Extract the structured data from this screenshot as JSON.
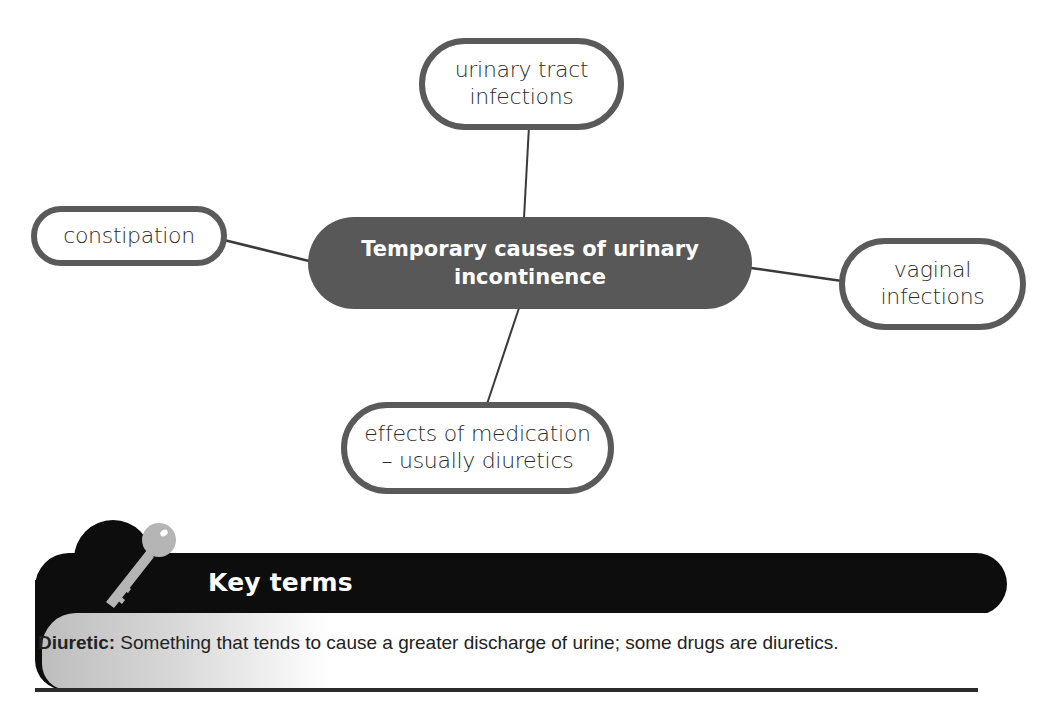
{
  "diagram": {
    "type": "mind-map",
    "center": {
      "lines": [
        "Temporary causes of urinary",
        "incontinence"
      ],
      "fill_color": "#585858",
      "text_color": "#ffffff"
    },
    "branches": [
      {
        "id": "urinary-tract-infections",
        "lines": [
          "urinary tract",
          "infections"
        ],
        "position": "top"
      },
      {
        "id": "constipation",
        "lines": [
          "constipation"
        ],
        "position": "left"
      },
      {
        "id": "vaginal-infections",
        "lines": [
          "vaginal",
          "infections"
        ],
        "position": "right"
      },
      {
        "id": "effects-of-medication",
        "lines": [
          "effects of medication",
          "– usually diuretics"
        ],
        "position": "bottom"
      }
    ],
    "border_color": "#5a5a5a",
    "connector_color": "#3a3a3a"
  },
  "key_terms": {
    "icon": "key-icon",
    "title": "Key terms",
    "header_color": "#0d0d0d",
    "definitions": [
      {
        "term": "Diuretic:",
        "definition": " Something that tends to cause a greater discharge of urine; some drugs are diuretics."
      }
    ]
  }
}
